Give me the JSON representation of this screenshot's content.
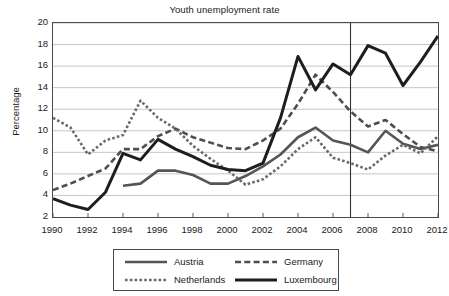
{
  "chart_data": {
    "type": "line",
    "title": "Youth unemployment rate",
    "xlabel": "",
    "ylabel": "Percentage",
    "xlim": [
      1990,
      2012
    ],
    "ylim": [
      2,
      20
    ],
    "yticks": [
      2,
      4,
      6,
      8,
      10,
      12,
      14,
      16,
      18,
      20
    ],
    "xticks": [
      1990,
      1992,
      1994,
      1996,
      1998,
      2000,
      2002,
      2004,
      2006,
      2008,
      2010,
      2012
    ],
    "xtick_labels": [
      "1990",
      "1992",
      "1994",
      "1996",
      "1998",
      "2000",
      "2002",
      "2004",
      "2006",
      "2008",
      "2010",
      "2012"
    ],
    "ytick_labels": [
      "2",
      "4",
      "6",
      "8",
      "10",
      "12",
      "14",
      "16",
      "18",
      "20"
    ],
    "grid": "horizontal",
    "legend_position": "below",
    "annotations": [
      {
        "type": "vline",
        "x": 2007,
        "label": ""
      }
    ],
    "x": [
      1990,
      1991,
      1992,
      1993,
      1994,
      1995,
      1996,
      1997,
      1998,
      1999,
      2000,
      2001,
      2002,
      2003,
      2004,
      2005,
      2006,
      2007,
      2008,
      2009,
      2010,
      2011,
      2012
    ],
    "series": [
      {
        "name": "Austria",
        "color": "#555555",
        "style": "solid",
        "width": 2.6,
        "x": [
          1994,
          1995,
          1996,
          1997,
          1998,
          1999,
          2000,
          2001,
          2002,
          2003,
          2004,
          2005,
          2006,
          2007,
          2008,
          2009,
          2010,
          2011,
          2012
        ],
        "values": [
          4.9,
          5.1,
          6.3,
          6.3,
          5.9,
          5.1,
          5.1,
          5.8,
          6.7,
          7.8,
          9.4,
          10.3,
          9.1,
          8.7,
          8.0,
          10.0,
          8.8,
          8.3,
          8.7
        ]
      },
      {
        "name": "Germany",
        "color": "#4e4e4e",
        "style": "dashed",
        "width": 2.6,
        "x": [
          1990,
          1991,
          1992,
          1993,
          1994,
          1995,
          1996,
          1997,
          1998,
          1999,
          2000,
          2001,
          2002,
          2003,
          2004,
          2005,
          2006,
          2007,
          2008,
          2009,
          2010,
          2011,
          2012
        ],
        "values": [
          4.5,
          5.1,
          5.8,
          6.5,
          8.3,
          8.3,
          9.5,
          10.2,
          9.4,
          8.9,
          8.4,
          8.3,
          9.1,
          10.2,
          12.5,
          15.2,
          13.6,
          11.8,
          10.4,
          11.0,
          9.7,
          8.5,
          8.1
        ]
      },
      {
        "name": "Netherlands",
        "color": "#6a6a6a",
        "style": "dotted",
        "width": 2.6,
        "x": [
          1990,
          1991,
          1992,
          1993,
          1994,
          1995,
          1996,
          1997,
          1998,
          1999,
          2000,
          2001,
          2002,
          2003,
          2004,
          2005,
          2006,
          2007,
          2008,
          2009,
          2010,
          2011,
          2012
        ],
        "values": [
          11.2,
          10.3,
          7.8,
          9.1,
          9.6,
          12.8,
          11.2,
          10.2,
          8.6,
          7.4,
          6.3,
          5.0,
          5.5,
          6.7,
          8.3,
          9.4,
          7.5,
          7.0,
          6.4,
          7.7,
          8.7,
          7.9,
          9.5
        ]
      },
      {
        "name": "Luxembourg",
        "color": "#1e1e1e",
        "style": "solid",
        "width": 3.0,
        "x": [
          1990,
          1991,
          1992,
          1993,
          1994,
          1995,
          1996,
          1997,
          1998,
          1999,
          2000,
          2001,
          2002,
          2003,
          2004,
          2005,
          2006,
          2007,
          2008,
          2009,
          2010,
          2011,
          2012
        ],
        "values": [
          3.7,
          3.1,
          2.7,
          4.3,
          7.9,
          7.3,
          9.2,
          8.3,
          7.6,
          6.8,
          6.4,
          6.3,
          7.0,
          11.2,
          16.9,
          13.8,
          16.2,
          15.2,
          17.9,
          17.2,
          14.2,
          16.4,
          18.8
        ]
      }
    ]
  },
  "legend": {
    "entries": [
      {
        "label": "Austria"
      },
      {
        "label": "Germany"
      },
      {
        "label": "Netherlands"
      },
      {
        "label": "Luxembourg"
      }
    ]
  }
}
